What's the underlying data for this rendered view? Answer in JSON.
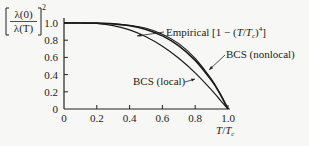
{
  "chart_data": {
    "type": "line",
    "title": "",
    "xlabel": "T/T_c",
    "ylabel": "[λ(0)/λ(T)]^2",
    "xlim": [
      0,
      1.0
    ],
    "ylim": [
      0,
      1.0
    ],
    "x_ticks": [
      "0",
      "0.2",
      "0.4",
      "0.6",
      "0.8",
      "1.0"
    ],
    "y_ticks": [
      "0",
      "0.2",
      "0.4",
      "0.6",
      "0.8",
      "1.0"
    ],
    "grid": false,
    "series": [
      {
        "name": "Empirical [1 − (T/T_c)^4]",
        "x": [
          0,
          0.1,
          0.2,
          0.3,
          0.4,
          0.5,
          0.6,
          0.7,
          0.8,
          0.9,
          0.95,
          1.0
        ],
        "y": [
          1.0,
          1.0,
          0.998,
          0.992,
          0.974,
          0.938,
          0.87,
          0.76,
          0.59,
          0.344,
          0.185,
          0.0
        ]
      },
      {
        "name": "BCS (nonlocal)",
        "x": [
          0,
          0.1,
          0.2,
          0.3,
          0.4,
          0.5,
          0.6,
          0.7,
          0.8,
          0.9,
          0.95,
          1.0
        ],
        "y": [
          1.0,
          1.0,
          0.999,
          0.99,
          0.968,
          0.925,
          0.85,
          0.735,
          0.565,
          0.33,
          0.18,
          0.0
        ]
      },
      {
        "name": "BCS (local)",
        "x": [
          0,
          0.1,
          0.2,
          0.3,
          0.4,
          0.5,
          0.6,
          0.7,
          0.8,
          0.9,
          0.95,
          1.0
        ],
        "y": [
          1.0,
          1.0,
          0.995,
          0.97,
          0.92,
          0.84,
          0.73,
          0.59,
          0.42,
          0.22,
          0.11,
          0.0
        ]
      }
    ],
    "annotations": [
      {
        "text": "Empirical [1 − (T/T_c)^4]",
        "points_to": "Empirical curve near x≈0.45"
      },
      {
        "text": "BCS (nonlocal)",
        "points_to": "nonlocal curve near x≈0.9"
      },
      {
        "text": "BCS (local)",
        "points_to": "local curve near x≈0.8"
      }
    ]
  },
  "labels": {
    "ylabel_num": "λ(0)",
    "ylabel_den": "λ(T)",
    "ylabel_exp": "2",
    "xlabel_T": "T",
    "xlabel_slash": "/",
    "xlabel_Tc": "T",
    "xlabel_c": "c",
    "empirical_prefix": "Empirical [1 − (",
    "empirical_T": "T",
    "empirical_slash": "/",
    "empirical_Tc": "T",
    "empirical_c": "c",
    "empirical_close": ")",
    "empirical_exp": "4",
    "empirical_end": "]",
    "nonlocal": "BCS (nonlocal)",
    "local": "BCS (local)"
  }
}
